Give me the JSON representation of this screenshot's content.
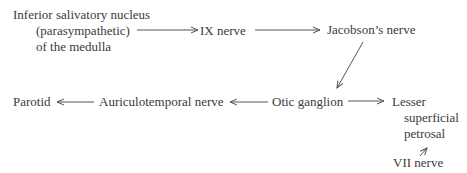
{
  "diagram": {
    "type": "flow-pathway",
    "nodes": {
      "nucleus": {
        "line1": "Inferior salivatory nucleus",
        "line2": "(parasympathetic)",
        "line3": "of the medulla"
      },
      "ix_nerve": "IX nerve",
      "jacobson": "Jacobson’s nerve",
      "otic": "Otic ganglion",
      "lesser": {
        "line1": "Lesser",
        "line2": "superficial",
        "line3": "petrosal"
      },
      "vii": "VII nerve",
      "auriculotemporal": "Auriculotemporal nerve",
      "parotid": "Parotid"
    },
    "edges": [
      {
        "from": "Inferior salivatory nucleus",
        "to": "IX nerve"
      },
      {
        "from": "IX nerve",
        "to": "Jacobson’s nerve"
      },
      {
        "from": "Jacobson’s nerve",
        "to": "Otic ganglion"
      },
      {
        "from": "Otic ganglion",
        "to": "Lesser superficial petrosal"
      },
      {
        "from": "VII nerve",
        "to": "Lesser superficial petrosal"
      },
      {
        "from": "Otic ganglion",
        "to": "Auriculotemporal nerve"
      },
      {
        "from": "Auriculotemporal nerve",
        "to": "Parotid"
      }
    ]
  }
}
